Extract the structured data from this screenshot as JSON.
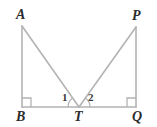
{
  "figure": {
    "background_color": "#ffffff",
    "line_color": "#b3b3b3",
    "label_color": "#2b2b2b",
    "angle_arc_color": "#b3b3b3",
    "width": 157,
    "height": 127
  },
  "vertex_labels": {
    "a": "A",
    "p": "P",
    "b": "B",
    "t": "T",
    "q": "Q"
  },
  "angle_labels": {
    "one": "1",
    "two": "2"
  },
  "points": {
    "A": {
      "x": 22,
      "y": 26
    },
    "P": {
      "x": 136,
      "y": 27
    },
    "B": {
      "x": 22,
      "y": 107
    },
    "T": {
      "x": 79,
      "y": 107
    },
    "Q": {
      "x": 136,
      "y": 107
    }
  },
  "segments": [
    {
      "name": "AB",
      "from": "A",
      "to": "B"
    },
    {
      "name": "AT",
      "from": "A",
      "to": "T"
    },
    {
      "name": "TP",
      "from": "T",
      "to": "P"
    },
    {
      "name": "PQ",
      "from": "P",
      "to": "Q"
    },
    {
      "name": "BQ",
      "from": "B",
      "to": "Q"
    }
  ],
  "right_angle_marks": [
    {
      "name": "right-angle-at-B",
      "vertex": "B"
    },
    {
      "name": "right-angle-at-Q",
      "vertex": "Q"
    }
  ],
  "angle_arcs": [
    {
      "name": "arc-angle-1",
      "vertex": "T",
      "label": "1"
    },
    {
      "name": "arc-angle-2",
      "vertex": "T",
      "label": "2"
    }
  ]
}
